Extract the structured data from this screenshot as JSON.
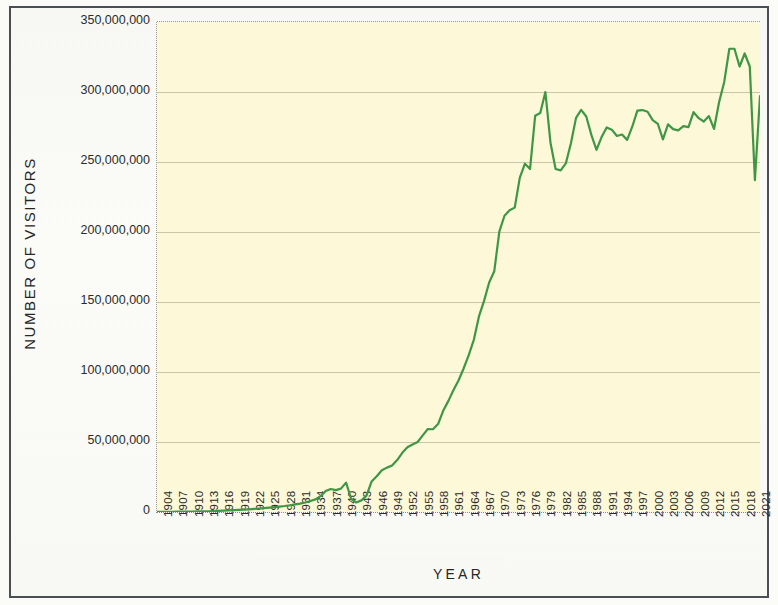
{
  "chart_data": {
    "type": "line",
    "title": "",
    "xlabel": "YEAR",
    "ylabel": "NUMBER OF VISITORS",
    "ylim": [
      0,
      350000000
    ],
    "xlim": [
      1904,
      2022
    ],
    "grid": true,
    "legend": false,
    "line_color": "#3f9644",
    "plot_background": "#fcf8d8",
    "gridline_color": "#c9c5a6",
    "y_ticks": [
      0,
      50000000,
      100000000,
      150000000,
      200000000,
      250000000,
      300000000,
      350000000
    ],
    "y_tick_labels": [
      "0",
      "50,000,000",
      "100,000,000",
      "150,000,000",
      "200,000,000",
      "250,000,000",
      "300,000,000",
      "350,000,000"
    ],
    "x_tick_labels": [
      "1904",
      "1907",
      "1910",
      "1913",
      "1916",
      "1919",
      "1922",
      "1925",
      "1928",
      "1931",
      "1934",
      "1937",
      "1940",
      "1943",
      "1946",
      "1949",
      "1952",
      "1955",
      "1958",
      "1961",
      "1964",
      "1967",
      "1970",
      "1973",
      "1976",
      "1979",
      "1982",
      "1985",
      "1988",
      "1991",
      "1994",
      "1997",
      "2000",
      "2003",
      "2006",
      "2009",
      "2012",
      "2015",
      "2018",
      "2021"
    ],
    "x": [
      1904,
      1905,
      1906,
      1907,
      1908,
      1909,
      1910,
      1911,
      1912,
      1913,
      1914,
      1915,
      1916,
      1917,
      1918,
      1919,
      1920,
      1921,
      1922,
      1923,
      1924,
      1925,
      1926,
      1927,
      1928,
      1929,
      1930,
      1931,
      1932,
      1933,
      1934,
      1935,
      1936,
      1937,
      1938,
      1939,
      1940,
      1941,
      1942,
      1943,
      1944,
      1945,
      1946,
      1947,
      1948,
      1949,
      1950,
      1951,
      1952,
      1953,
      1954,
      1955,
      1956,
      1957,
      1958,
      1959,
      1960,
      1961,
      1962,
      1963,
      1964,
      1965,
      1966,
      1967,
      1968,
      1969,
      1970,
      1971,
      1972,
      1973,
      1974,
      1975,
      1976,
      1977,
      1978,
      1979,
      1980,
      1981,
      1982,
      1983,
      1984,
      1985,
      1986,
      1987,
      1988,
      1989,
      1990,
      1991,
      1992,
      1993,
      1994,
      1995,
      1996,
      1997,
      1998,
      1999,
      2000,
      2001,
      2002,
      2003,
      2004,
      2005,
      2006,
      2007,
      2008,
      2009,
      2010,
      2011,
      2012,
      2013,
      2014,
      2015,
      2016,
      2017,
      2018,
      2019,
      2020,
      2021,
      2022
    ],
    "y": [
      120690,
      140954,
      160000,
      175000,
      200000,
      260000,
      300000,
      335000,
      400000,
      470000,
      550000,
      680000,
      800000,
      950000,
      1100000,
      1300000,
      1500000,
      1700000,
      1900000,
      2200000,
      2500000,
      2800000,
      3150000,
      3500000,
      3900000,
      4300000,
      4800000,
      5400000,
      6000000,
      6800000,
      7800000,
      9000000,
      11300000,
      15000000,
      16400000,
      15600000,
      16700000,
      21000000,
      9300000,
      6800000,
      8300000,
      11700000,
      21800000,
      25500000,
      29800000,
      31700000,
      33200000,
      37100000,
      42300000,
      46200000,
      48200000,
      50000000,
      54700000,
      59300000,
      59100000,
      62800000,
      72300000,
      79200000,
      86900000,
      93900000,
      102500000,
      112000000,
      123000000,
      139700000,
      150800000,
      163900000,
      172000000,
      200500000,
      211600000,
      215500000,
      217400000,
      238800000,
      248800000,
      245000000,
      283000000,
      285000000,
      300000000,
      263800000,
      245000000,
      244000000,
      249000000,
      263400000,
      281500000,
      287200000,
      282500000,
      269400000,
      258700000,
      267800000,
      274700000,
      273100000,
      268600000,
      269600000,
      265800000,
      275200000,
      286700000,
      287100000,
      285900000,
      279900000,
      277300000,
      266100000,
      276900000,
      273500000,
      272600000,
      275600000,
      274900000,
      285600000,
      281300000,
      278900000,
      282800000,
      273600000,
      292800000,
      307200000,
      330900000,
      330900000,
      318200000,
      327500000,
      318200000,
      237100000,
      297100000,
      311900000
    ]
  },
  "axis": {
    "y_title": "NUMBER OF VISITORS",
    "x_title": "YEAR"
  }
}
